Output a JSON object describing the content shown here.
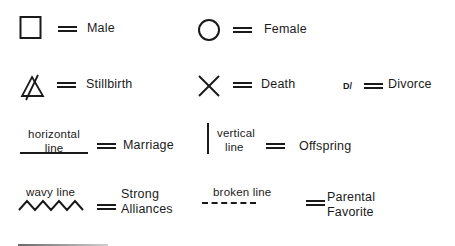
{
  "legend": {
    "items": [
      {
        "symbol": "square",
        "label": "Male"
      },
      {
        "symbol": "circle",
        "label": "Female"
      },
      {
        "symbol": "triangle-struck",
        "label": "Stillbirth"
      },
      {
        "symbol": "x-cross",
        "label": "Death"
      },
      {
        "symbol": "D/",
        "label": "Divorce"
      },
      {
        "symbol_caption": [
          "horizontal",
          "line"
        ],
        "label": "Marriage"
      },
      {
        "symbol_caption": [
          "vertical",
          "line"
        ],
        "label": "Offspring"
      },
      {
        "symbol_caption": [
          "wavy line"
        ],
        "label": [
          "Strong",
          "Alliances"
        ]
      },
      {
        "symbol_caption": [
          "broken line"
        ],
        "label": [
          "Parental",
          "Favorite"
        ]
      }
    ],
    "divorce_symbol": "D/",
    "equals_sign": "="
  }
}
